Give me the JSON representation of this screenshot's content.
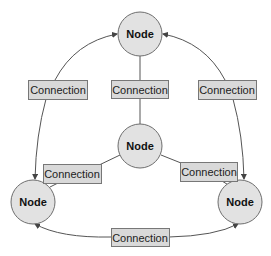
{
  "diagram": {
    "nodes": [
      {
        "id": "top",
        "label": "Node",
        "cx": 140,
        "cy": 34,
        "r": 22
      },
      {
        "id": "center",
        "label": "Node",
        "cx": 140,
        "cy": 146,
        "r": 22
      },
      {
        "id": "left",
        "label": "Node",
        "cx": 33,
        "cy": 202,
        "r": 22
      },
      {
        "id": "right",
        "label": "Node",
        "cx": 240,
        "cy": 202,
        "r": 22
      }
    ],
    "connections": [
      {
        "id": "left-top",
        "label": "Connection",
        "x": 28,
        "y": 80,
        "w": 59,
        "h": 19
      },
      {
        "id": "center-top",
        "label": "Connection",
        "x": 111,
        "y": 80,
        "w": 57,
        "h": 18
      },
      {
        "id": "right-top",
        "label": "Connection",
        "x": 198,
        "y": 80,
        "w": 58,
        "h": 19
      },
      {
        "id": "center-left",
        "label": "Connection",
        "x": 43,
        "y": 164,
        "w": 58,
        "h": 19
      },
      {
        "id": "center-right",
        "label": "Connection",
        "x": 180,
        "y": 162,
        "w": 57,
        "h": 19
      },
      {
        "id": "bottom",
        "label": "Connection",
        "x": 111,
        "y": 228,
        "w": 58,
        "h": 18
      }
    ],
    "colors": {
      "node_fill": "#e2e2e2",
      "node_stroke": "#6e6e6e",
      "label_fill": "#d9d9d9",
      "label_stroke": "#777777",
      "edge": "#555555"
    }
  }
}
